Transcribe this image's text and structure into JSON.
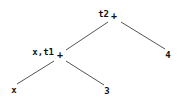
{
  "figure": {
    "kind": "expression-tree",
    "background_color": "#ffffff",
    "ink_color": "#111111",
    "edge_color": "#555555"
  },
  "nodes": [
    {
      "id": "root",
      "label": "+",
      "annotation": "t2",
      "x": 114,
      "y": 16
    },
    {
      "id": "inner",
      "label": "+",
      "annotation": "x,t1",
      "x": 60,
      "y": 55
    },
    {
      "id": "leaf-four",
      "label": "4",
      "annotation": "",
      "x": 168,
      "y": 55
    },
    {
      "id": "leaf-x",
      "label": "x",
      "annotation": "",
      "x": 14,
      "y": 90
    },
    {
      "id": "leaf-three",
      "label": "3",
      "annotation": "",
      "x": 107,
      "y": 91
    }
  ],
  "edges": [
    {
      "id": "root-to-inner",
      "from": "root",
      "to": "inner",
      "x1": 108,
      "y1": 22,
      "x2": 66,
      "y2": 50
    },
    {
      "id": "root-to-four",
      "from": "root",
      "to": "leaf-four",
      "x1": 121,
      "y1": 22,
      "x2": 165,
      "y2": 49
    },
    {
      "id": "inner-to-x",
      "from": "inner",
      "to": "leaf-x",
      "x1": 54,
      "y1": 61,
      "x2": 17,
      "y2": 84
    },
    {
      "id": "inner-to-three",
      "from": "inner",
      "to": "leaf-three",
      "x1": 66,
      "y1": 61,
      "x2": 104,
      "y2": 85
    }
  ]
}
